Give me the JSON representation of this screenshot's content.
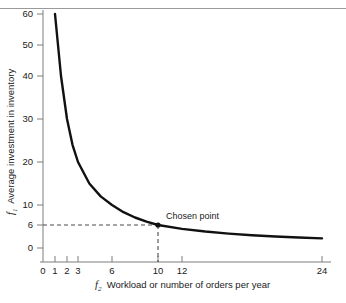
{
  "chart_data": {
    "type": "line",
    "title": "",
    "subtitle": "",
    "xlabel_symbol": "f",
    "xlabel_subscript": "2",
    "xlabel": "Workload or number of orders per year",
    "ylabel_symbol": "f",
    "ylabel_subscript": "1",
    "ylabel": "Average investment in inventory",
    "grid": false,
    "legend": "none",
    "relation": "f1 = 60 / f2",
    "xlim": [
      0,
      24
    ],
    "ylim": [
      0,
      62
    ],
    "x_scale": "compressed-nonlinear",
    "y_scale": "linear",
    "x_ticks": [
      0,
      1,
      2,
      3,
      6,
      10,
      12,
      24
    ],
    "x_tick_labels": [
      "0",
      "1",
      "2",
      "3",
      "6",
      "10",
      "12",
      "24"
    ],
    "x_tick_px": [
      43,
      55,
      67,
      78,
      112,
      158,
      182,
      322
    ],
    "y_ticks": [
      0,
      6,
      10,
      20,
      30,
      40,
      50,
      60
    ],
    "y_tick_labels": [
      "0",
      "6",
      "10",
      "20",
      "30",
      "40",
      "50",
      "60"
    ],
    "y_tick_px": [
      248,
      225,
      205,
      162,
      119,
      76,
      45,
      14
    ],
    "series": [
      {
        "name": "average investment curve",
        "x": [
          1,
          1.5,
          2,
          2.5,
          3,
          4,
          5,
          6,
          7,
          8,
          9,
          10,
          12,
          14,
          16,
          18,
          20,
          22,
          24
        ],
        "y": [
          60,
          40,
          30,
          24,
          20,
          15,
          12,
          10,
          8.57,
          7.5,
          6.67,
          6,
          5,
          4.29,
          3.75,
          3.33,
          3,
          2.73,
          2.5
        ]
      }
    ],
    "annotations": [
      {
        "label": "Chosen point",
        "x": 10,
        "y": 6,
        "marker": "dot",
        "guide_lines": [
          "horizontal-to-y-axis",
          "vertical-to-x-axis"
        ]
      }
    ]
  },
  "colors": {
    "curve": "#111111",
    "axis": "#7d7d7d",
    "guide": "#4a4a4a",
    "text": "#1a1a1a",
    "rule": "#9a9a9a",
    "background": "#ffffff"
  }
}
